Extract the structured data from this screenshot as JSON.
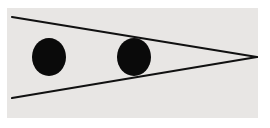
{
  "figure": {
    "type": "ponzo-illusion",
    "background_color": "#ffffff",
    "panel": {
      "x": 7,
      "y": 8,
      "width": 251,
      "height": 110,
      "color": "#e8e6e4"
    },
    "line_color": "#111111",
    "dot_color": "#0a0a0a",
    "lines": [
      {
        "name": "upper-converging-line",
        "x1": 12,
        "y1": 17,
        "x2": 257,
        "y2": 57
      },
      {
        "name": "lower-converging-line",
        "x1": 12,
        "y1": 98,
        "x2": 257,
        "y2": 57
      }
    ],
    "dots": [
      {
        "name": "left-dot",
        "cx": 49,
        "cy": 57,
        "rx": 17,
        "ry": 19
      },
      {
        "name": "right-dot",
        "cx": 134,
        "cy": 57,
        "rx": 17,
        "ry": 19
      }
    ]
  }
}
